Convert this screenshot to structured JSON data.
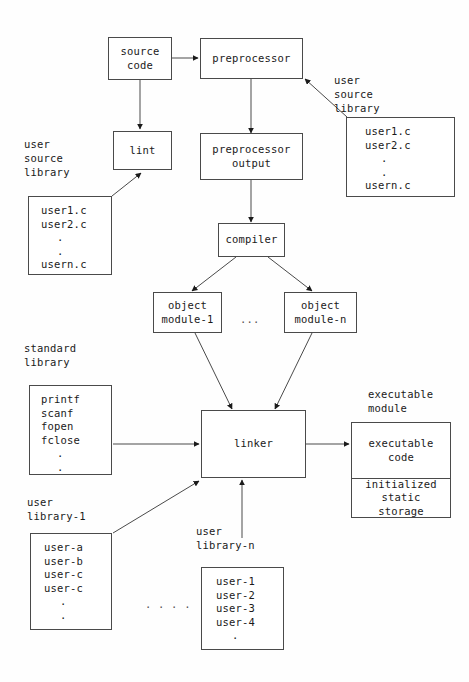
{
  "diagram": {
    "stroke_color": "#4a4a4a",
    "text_color": "#1a1a1a",
    "nodes": {
      "source_code": {
        "line1": "source",
        "line2": "code"
      },
      "preprocessor": {
        "line1": "preprocessor"
      },
      "lint": {
        "line1": "lint"
      },
      "preprocessor_output": {
        "line1": "preprocessor",
        "line2": "output"
      },
      "compiler": {
        "line1": "compiler"
      },
      "object_module_1": {
        "line1": "object",
        "line2": "module-1"
      },
      "object_module_n": {
        "line1": "object",
        "line2": "module-n"
      },
      "linker": {
        "line1": "linker"
      },
      "executable_code": {
        "line1": "executable",
        "line2": "code"
      },
      "initialized_static_storage": {
        "line1": "initialized",
        "line2": "static",
        "line3": "storage"
      }
    },
    "captions": {
      "user_source_library_left": "user\nsource\nlibrary",
      "user_source_library_right": "user\nsource\nlibrary",
      "standard_library": "standard\nlibrary",
      "user_library_1": "user\nlibrary-1",
      "user_library_n": "user\nlibrary-n",
      "executable_module": "executable\nmodule"
    },
    "lists": {
      "user_source_library_left": [
        "user1.c",
        "user2.c",
        ".",
        ".",
        "usern.c"
      ],
      "user_source_library_right": [
        "user1.c",
        "user2.c",
        ".",
        ".",
        "usern.c"
      ],
      "standard_library": [
        "printf",
        "scanf",
        "fopen",
        "fclose",
        ".",
        "."
      ],
      "user_library_1": [
        "user-a",
        "user-b",
        "user-c",
        "user-c",
        ".",
        "."
      ],
      "user_library_n": [
        "user-1",
        "user-2",
        "user-3",
        "user-4",
        "."
      ]
    },
    "ellipses": {
      "between_object_modules": "...",
      "between_user_libraries": ". . . ."
    }
  }
}
